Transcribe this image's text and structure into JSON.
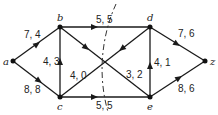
{
  "diagram": {
    "type": "flow-network",
    "nodes": [
      {
        "id": "a",
        "label": "a",
        "x": 13,
        "y": 61
      },
      {
        "id": "b",
        "label": "b",
        "x": 60,
        "y": 27
      },
      {
        "id": "c",
        "label": "c",
        "x": 60,
        "y": 97
      },
      {
        "id": "d",
        "label": "d",
        "x": 150,
        "y": 27
      },
      {
        "id": "e",
        "label": "e",
        "x": 150,
        "y": 97
      },
      {
        "id": "z",
        "label": "z",
        "x": 205,
        "y": 61
      }
    ],
    "edges": [
      {
        "from": "a",
        "to": "b",
        "label": "7, 4"
      },
      {
        "from": "a",
        "to": "c",
        "label": "8, 8"
      },
      {
        "from": "c",
        "to": "b",
        "label": "4, 3"
      },
      {
        "from": "b",
        "to": "d",
        "label": "5, 5"
      },
      {
        "from": "b",
        "to": "e",
        "label": "3, 2"
      },
      {
        "from": "d",
        "to": "c",
        "label": "4, 0"
      },
      {
        "from": "c",
        "to": "e",
        "label": "5, 5"
      },
      {
        "from": "e",
        "to": "d",
        "label": "4, 1"
      },
      {
        "from": "d",
        "to": "z",
        "label": "7, 6"
      },
      {
        "from": "e",
        "to": "z",
        "label": "8, 6"
      }
    ],
    "cut": "dashed curve crossing edges b-d, b-e, d-c, c-e"
  },
  "labels": {
    "a": "a",
    "b": "b",
    "c": "c",
    "d": "d",
    "e": "e",
    "z": "z",
    "ab": "7, 4",
    "ac": "8, 8",
    "cb": "4, 3",
    "bd": "5, 5",
    "be": "3, 2",
    "dc": "4, 0",
    "ce": "5, 5",
    "ed": "4, 1",
    "dz": "7, 6",
    "ez": "8, 6"
  }
}
